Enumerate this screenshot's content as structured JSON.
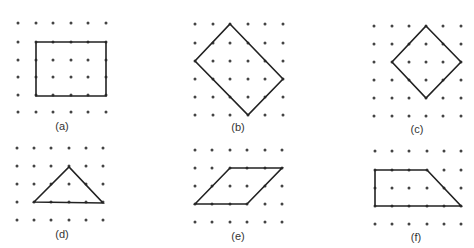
{
  "colors": {
    "dot": "#444444",
    "line": "#222222",
    "label": "#333333"
  },
  "figures": [
    {
      "label": "(a)",
      "shape": "rectangle",
      "grid": {
        "x": [
          18,
          36,
          53,
          71,
          88,
          106
        ],
        "y": [
          23,
          42,
          60,
          77,
          95,
          112
        ]
      },
      "vertices": [
        [
          36,
          42
        ],
        [
          106,
          42
        ],
        [
          106,
          96
        ],
        [
          36,
          96
        ]
      ],
      "label_pos": [
        62,
        130
      ]
    },
    {
      "label": "(b)",
      "shape": "tilted rectangle",
      "grid": {
        "x": [
          195,
          213,
          230,
          248,
          265,
          283
        ],
        "y": [
          24,
          43,
          61,
          79,
          97,
          115
        ]
      },
      "vertices": [
        [
          230,
          24
        ],
        [
          283,
          79
        ],
        [
          248,
          115
        ],
        [
          195,
          61
        ]
      ],
      "label_pos": [
        238,
        131
      ]
    },
    {
      "label": "(c)",
      "shape": "square (diamond)",
      "grid": {
        "x": [
          374,
          392,
          409,
          426,
          443,
          461
        ],
        "y": [
          26,
          44,
          62,
          80,
          98,
          116
        ]
      },
      "vertices": [
        [
          426,
          26
        ],
        [
          461,
          62
        ],
        [
          426,
          98
        ],
        [
          392,
          62
        ]
      ],
      "label_pos": [
        417,
        133
      ]
    },
    {
      "label": "(d)",
      "shape": "triangle",
      "grid": {
        "x": [
          17,
          34,
          51,
          69,
          86,
          103
        ],
        "y": [
          148,
          166,
          184,
          202,
          220
        ]
      },
      "vertices": [
        [
          34,
          202
        ],
        [
          69,
          167
        ],
        [
          103,
          203
        ]
      ],
      "label_pos": [
        62,
        238
      ]
    },
    {
      "label": "(e)",
      "shape": "parallelogram",
      "grid": {
        "x": [
          195,
          212,
          230,
          247,
          265,
          282
        ],
        "y": [
          150,
          168,
          186,
          204,
          222
        ]
      },
      "vertices": [
        [
          195,
          204
        ],
        [
          230,
          168
        ],
        [
          282,
          168
        ],
        [
          247,
          204
        ]
      ],
      "label_pos": [
        238,
        240
      ]
    },
    {
      "label": "(f)",
      "shape": "trapezoid",
      "grid": {
        "x": [
          375,
          392,
          409,
          427,
          444,
          461
        ],
        "y": [
          151,
          170,
          188,
          206,
          224
        ]
      },
      "vertices": [
        [
          375,
          170
        ],
        [
          427,
          170
        ],
        [
          461,
          206
        ],
        [
          375,
          206
        ]
      ],
      "label_pos": [
        416,
        241
      ]
    }
  ]
}
